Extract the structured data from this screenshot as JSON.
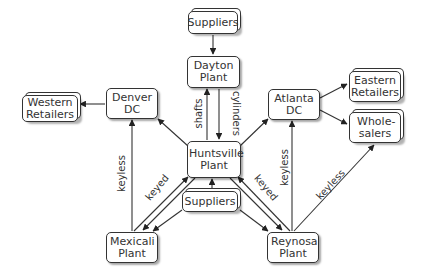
{
  "nodes": {
    "suppliers_top": "Suppliers",
    "dayton": "Dayton Plant",
    "denver": "Denver DC",
    "western": "Western Retailers",
    "atlanta": "Atlanta DC",
    "eastern": "Eastern Retailers",
    "wholesalers": "Whole-salers",
    "huntsville": "Huntsville Plant",
    "suppliers_bottom": "Suppliers",
    "mexicali": "Mexicali Plant",
    "reynosa": "Reynosa Plant"
  },
  "edge_labels": {
    "shafts": "shafts",
    "cylinders": "cylinders",
    "keyless_mex": "keyless",
    "keyed_mex": "keyed",
    "keyed_rey": "keyed",
    "keyless_rey": "keyless",
    "keyless_whole": "keyless"
  },
  "colors": {
    "line": "#333333",
    "box_fill": "#ffffff"
  }
}
